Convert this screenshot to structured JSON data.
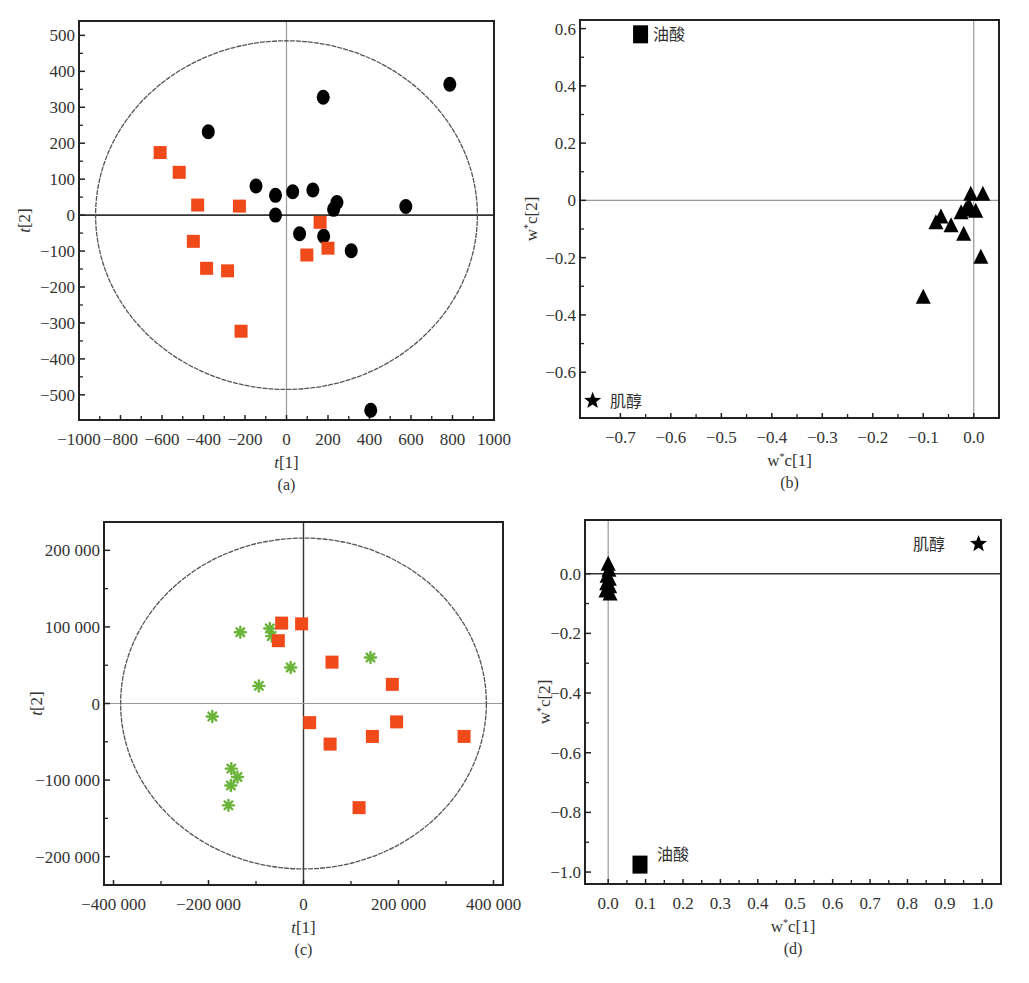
{
  "figure": {
    "panels": [
      {
        "id": "a",
        "caption": "(a)"
      },
      {
        "id": "b",
        "caption": "(b)"
      },
      {
        "id": "c",
        "caption": "(c)"
      },
      {
        "id": "d",
        "caption": "(d)"
      }
    ]
  },
  "colors": {
    "orange_square": "#f04a1a",
    "black_marker": "#000000",
    "green_star": "#6ab43a",
    "axis": "#222222",
    "zero_line_light": "#999999",
    "ellipse": "#555555"
  },
  "chart_data": [
    {
      "panel": "a",
      "type": "scatter",
      "title": "",
      "caption": "(a)",
      "xlabel": "t[1]",
      "ylabel": "t[2]",
      "xlim": [
        -1000,
        1000
      ],
      "ylim": [
        -570,
        540
      ],
      "xticks": [
        -1000,
        -800,
        -600,
        -400,
        -200,
        0,
        200,
        400,
        600,
        800,
        1000
      ],
      "xtick_labels": [
        "−1000",
        "−800",
        "−600",
        "−400",
        "−200",
        "0",
        "200",
        "400",
        "600",
        "800",
        "1000"
      ],
      "yticks": [
        500,
        400,
        300,
        200,
        100,
        0,
        -100,
        -200,
        -300,
        -400,
        -500
      ],
      "ytick_labels": [
        "500",
        "400",
        "300",
        "200",
        "100",
        "0",
        "−100",
        "−200",
        "−300",
        "−400",
        "−500"
      ],
      "grid": false,
      "hotelling_ellipse": {
        "rx": 920,
        "ry": 485
      },
      "series": [
        {
          "name": "Group 1 (black circles)",
          "marker": "circle",
          "color": "#000000",
          "points": [
            [
              -377,
              232
            ],
            [
              177,
              328
            ],
            [
              787,
              364
            ],
            [
              -147,
              81
            ],
            [
              -53,
              55
            ],
            [
              30,
              65
            ],
            [
              127,
              70
            ],
            [
              -53,
              0
            ],
            [
              243,
              35
            ],
            [
              227,
              16
            ],
            [
              575,
              24
            ],
            [
              63,
              -52
            ],
            [
              179,
              -59
            ],
            [
              312,
              -99
            ],
            [
              406,
              -543
            ]
          ]
        },
        {
          "name": "Group 2 (orange squares)",
          "marker": "square",
          "color": "#f04a1a",
          "points": [
            [
              -609,
              174
            ],
            [
              -517,
              119
            ],
            [
              -428,
              28
            ],
            [
              -227,
              25
            ],
            [
              -449,
              -73
            ],
            [
              -385,
              -148
            ],
            [
              -284,
              -155
            ],
            [
              -219,
              -323
            ],
            [
              162,
              -20
            ],
            [
              98,
              -111
            ],
            [
              200,
              -92
            ]
          ]
        }
      ]
    },
    {
      "panel": "b",
      "type": "scatter",
      "title": "",
      "caption": "(b)",
      "xlabel": "w*c[1]",
      "ylabel": "w*c[2]",
      "xlim": [
        -0.78,
        0.05
      ],
      "ylim": [
        -0.76,
        0.63
      ],
      "xticks": [
        -0.7,
        -0.6,
        -0.5,
        -0.4,
        -0.3,
        -0.2,
        -0.1,
        0.0
      ],
      "xtick_labels": [
        "−0.7",
        "−0.6",
        "−0.5",
        "−0.4",
        "−0.3",
        "−0.2",
        "−0.1",
        "0.0"
      ],
      "yticks": [
        0.6,
        0.4,
        0.2,
        0,
        -0.2,
        -0.4,
        -0.6
      ],
      "ytick_labels": [
        "0.6",
        "0.4",
        "0.2",
        "0",
        "−0.2",
        "−0.4",
        "−0.6"
      ],
      "grid": false,
      "series": [
        {
          "name": "Other variables",
          "marker": "triangle",
          "color": "#000000",
          "points": [
            [
              0.018,
              0.02
            ],
            [
              -0.006,
              0.02
            ],
            [
              -0.01,
              -0.02
            ],
            [
              -0.016,
              -0.035
            ],
            [
              -0.025,
              -0.045
            ],
            [
              0.004,
              -0.04
            ],
            [
              -0.065,
              -0.06
            ],
            [
              -0.045,
              -0.09
            ],
            [
              -0.075,
              -0.08
            ],
            [
              -0.02,
              -0.12
            ],
            [
              0.014,
              -0.2
            ],
            [
              -0.1,
              -0.34
            ]
          ]
        },
        {
          "name": "油酸",
          "marker": "square",
          "color": "#000000",
          "points": [
            [
              -0.66,
              0.58
            ]
          ]
        },
        {
          "name": "肌醇",
          "marker": "star",
          "color": "#000000",
          "points": [
            [
              -0.755,
              -0.7
            ]
          ]
        }
      ],
      "annotations": [
        {
          "text": "油酸",
          "x": -0.635,
          "y": 0.58
        },
        {
          "text": "肌醇",
          "x": -0.72,
          "y": -0.7
        }
      ]
    },
    {
      "panel": "c",
      "type": "scatter",
      "title": "",
      "caption": "(c)",
      "xlabel": "t[1]",
      "ylabel": "t[2]",
      "xlim": [
        -420000,
        420000
      ],
      "ylim": [
        -237000,
        237000
      ],
      "xticks": [
        -400000,
        -200000,
        0,
        200000,
        400000
      ],
      "xtick_labels": [
        "−400 000",
        "−200 000",
        "0",
        "200 000",
        "400 000"
      ],
      "xminor": [
        -300000,
        -100000,
        100000,
        300000
      ],
      "yticks": [
        200000,
        100000,
        0,
        -100000,
        -200000
      ],
      "ytick_labels": [
        "200 000",
        "100 000",
        "0",
        "−100 000",
        "−200 000"
      ],
      "yminor": [
        150000,
        50000,
        -50000,
        -150000
      ],
      "grid": false,
      "hotelling_ellipse": {
        "rx": 385000,
        "ry": 216000
      },
      "series": [
        {
          "name": "Group 1 (green stars)",
          "marker": "star",
          "color": "#6ab43a",
          "points": [
            [
              -133000,
              93000
            ],
            [
              -71000,
              98000
            ],
            [
              -67000,
              88000
            ],
            [
              -27000,
              47000
            ],
            [
              -94000,
              23000
            ],
            [
              -192000,
              -17000
            ],
            [
              141000,
              60000
            ],
            [
              -152000,
              -85000
            ],
            [
              -139000,
              -96000
            ],
            [
              -153000,
              -107000
            ],
            [
              -158000,
              -133000
            ]
          ]
        },
        {
          "name": "Group 2 (orange squares)",
          "marker": "square",
          "color": "#f04a1a",
          "points": [
            [
              -46000,
              105000
            ],
            [
              -4000,
              104000
            ],
            [
              -53000,
              82000
            ],
            [
              60000,
              54000
            ],
            [
              187000,
              25000
            ],
            [
              13000,
              -25000
            ],
            [
              196000,
              -24000
            ],
            [
              145000,
              -43000
            ],
            [
              338000,
              -43000
            ],
            [
              56000,
              -53000
            ],
            [
              117000,
              -136000
            ]
          ]
        }
      ]
    },
    {
      "panel": "d",
      "type": "scatter",
      "title": "",
      "caption": "(d)",
      "xlabel": "w*c[1]",
      "ylabel": "w*c[2]",
      "xlim": [
        -0.062,
        1.05
      ],
      "ylim": [
        -1.04,
        0.18
      ],
      "xticks": [
        0.0,
        0.1,
        0.2,
        0.3,
        0.4,
        0.5,
        0.6,
        0.7,
        0.8,
        0.9,
        1.0
      ],
      "xtick_labels": [
        "0.0",
        "0.1",
        "0.2",
        "0.3",
        "0.4",
        "0.5",
        "0.6",
        "0.7",
        "0.8",
        "0.9",
        "1.0"
      ],
      "yticks": [
        0.0,
        -0.2,
        -0.4,
        -0.6,
        -0.8,
        -1.0
      ],
      "ytick_labels": [
        "0.0",
        "−0.2",
        "−0.4",
        "−0.6",
        "−0.8",
        "−1.0"
      ],
      "grid": false,
      "series": [
        {
          "name": "Other variables",
          "marker": "triangle",
          "color": "#000000",
          "points": [
            [
              0.0,
              0.03
            ],
            [
              0.002,
              0.01
            ],
            [
              -0.003,
              -0.01
            ],
            [
              0.003,
              -0.02
            ],
            [
              -0.004,
              -0.035
            ],
            [
              0.004,
              -0.045
            ],
            [
              -0.006,
              -0.06
            ],
            [
              0.005,
              -0.07
            ]
          ]
        },
        {
          "name": "肌醇",
          "marker": "star",
          "color": "#000000",
          "points": [
            [
              0.99,
              0.1
            ]
          ]
        },
        {
          "name": "油酸",
          "marker": "square",
          "color": "#000000",
          "points": [
            [
              0.085,
              -0.975
            ]
          ]
        }
      ],
      "annotations": [
        {
          "text": "肌醇",
          "x": 0.815,
          "y": 0.1
        },
        {
          "text": "油酸",
          "x": 0.13,
          "y": -0.94
        }
      ]
    }
  ]
}
